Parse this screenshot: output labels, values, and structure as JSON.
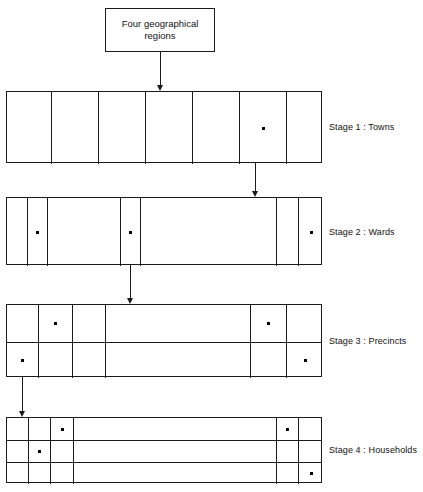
{
  "figure": {
    "top_box": {
      "label": "Four geographical regions"
    },
    "stages": [
      {
        "id": "stage-1",
        "label": "Stage 1 : Towns",
        "rows": 1,
        "columns": 7,
        "dots": [
          {
            "row": 1,
            "col": 6
          }
        ]
      },
      {
        "id": "stage-2",
        "label": "Stage 2 : Wards",
        "rows": 1,
        "columns": 7,
        "dots": [
          {
            "row": 1,
            "col": 2
          },
          {
            "row": 1,
            "col": 4
          },
          {
            "row": 1,
            "col": 7
          }
        ]
      },
      {
        "id": "stage-3",
        "label": "Stage 3 : Precincts",
        "rows": 2,
        "columns": 6,
        "dots": [
          {
            "row": 1,
            "col": 2
          },
          {
            "row": 1,
            "col": 5
          },
          {
            "row": 2,
            "col": 1
          },
          {
            "row": 2,
            "col": 6
          }
        ]
      },
      {
        "id": "stage-4",
        "label": "Stage 4 : Households",
        "rows": 3,
        "columns": 6,
        "dots": [
          {
            "row": 1,
            "col": 3
          },
          {
            "row": 1,
            "col": 5
          },
          {
            "row": 2,
            "col": 2
          },
          {
            "row": 3,
            "col": 6
          }
        ]
      }
    ],
    "arrows": [
      {
        "id": "arrow-regions-to-stage-1",
        "from": "Four geographical regions",
        "to": "Stage 1 : Towns"
      },
      {
        "id": "arrow-stage-1-to-stage-2",
        "from": "Stage 1 : Towns",
        "to": "Stage 2 : Wards"
      },
      {
        "id": "arrow-stage-2-to-stage-3",
        "from": "Stage 2 : Wards",
        "to": "Stage 3 : Precincts"
      },
      {
        "id": "arrow-stage-3-to-stage-4",
        "from": "Stage 3 : Precincts",
        "to": "Stage 4 : Households"
      }
    ],
    "colors": {
      "stroke": "#1a1a1a",
      "background": "#ffffff",
      "dot": "#000000",
      "text": "#111111"
    }
  },
  "layout": {
    "top_box": {
      "x": 105,
      "y": 8,
      "w": 110,
      "h": 44
    },
    "stage_geometry": [
      {
        "x": 6,
        "y": 91,
        "w": 316,
        "h": 72,
        "col_edges": [
          0,
          45,
          92,
          139,
          186,
          233,
          280,
          316
        ],
        "row_edges": [
          0,
          72
        ]
      },
      {
        "x": 6,
        "y": 197,
        "w": 316,
        "h": 68,
        "col_edges": [
          0,
          21,
          41,
          114,
          134,
          270,
          292,
          316
        ],
        "row_edges": [
          0,
          68
        ]
      },
      {
        "x": 6,
        "y": 304,
        "w": 316,
        "h": 73,
        "col_edges": [
          0,
          32,
          66,
          99,
          244,
          280,
          316
        ],
        "row_edges": [
          0,
          37,
          73
        ]
      },
      {
        "x": 6,
        "y": 417,
        "w": 316,
        "h": 66,
        "col_edges": [
          0,
          22,
          44,
          67,
          270,
          292,
          316
        ],
        "row_edges": [
          0,
          22,
          44,
          66
        ]
      }
    ],
    "stage_label_positions": [
      {
        "x": 329,
        "y": 122
      },
      {
        "x": 329,
        "y": 227
      },
      {
        "x": 329,
        "y": 336
      },
      {
        "x": 329,
        "y": 445
      }
    ],
    "arrow_positions": [
      {
        "x": 160,
        "y": 52,
        "len": 39
      },
      {
        "x": 255,
        "y": 163,
        "len": 34
      },
      {
        "x": 130,
        "y": 265,
        "len": 39
      },
      {
        "x": 22,
        "y": 377,
        "len": 40
      }
    ]
  }
}
